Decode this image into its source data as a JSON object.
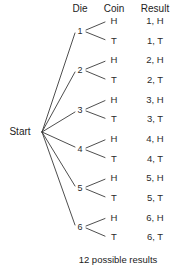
{
  "diagram": {
    "title_caption": "12 possible results",
    "start_label": "Start",
    "columns": [
      {
        "key": "die",
        "label": "Die"
      },
      {
        "key": "coin",
        "label": "Coin"
      },
      {
        "key": "result",
        "label": "Result"
      }
    ],
    "die_outcomes": [
      "1",
      "2",
      "3",
      "4",
      "5",
      "6"
    ],
    "coin_outcomes": [
      "H",
      "T"
    ],
    "leaves": [
      {
        "die": "1",
        "coin": "H",
        "result": "1, H"
      },
      {
        "die": "1",
        "coin": "T",
        "result": "1, T"
      },
      {
        "die": "2",
        "coin": "H",
        "result": "2, H"
      },
      {
        "die": "2",
        "coin": "T",
        "result": "2, T"
      },
      {
        "die": "3",
        "coin": "H",
        "result": "3, H"
      },
      {
        "die": "3",
        "coin": "T",
        "result": "3, T"
      },
      {
        "die": "4",
        "coin": "H",
        "result": "4, H"
      },
      {
        "die": "4",
        "coin": "T",
        "result": "4, T"
      },
      {
        "die": "5",
        "coin": "H",
        "result": "5, H"
      },
      {
        "die": "5",
        "coin": "T",
        "result": "5, T"
      },
      {
        "die": "6",
        "coin": "H",
        "result": "6, H"
      },
      {
        "die": "6",
        "coin": "T",
        "result": "6, T"
      }
    ],
    "total_results": 12,
    "colors": {
      "background": "#ffffff",
      "line": "#3a3a3a",
      "text": "#222222"
    },
    "geometry": {
      "start_x": 42,
      "start_y": 132,
      "die_x": 82,
      "coin_x": 112,
      "result_x": 155,
      "header_y": 9,
      "first_leaf_y": 21,
      "leaf_spacing": 19.65,
      "caption_y": 260
    }
  }
}
